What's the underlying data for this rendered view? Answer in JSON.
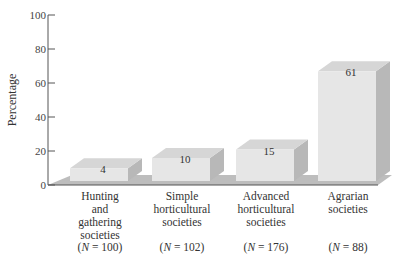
{
  "chart_data": {
    "type": "bar",
    "title": "",
    "xlabel": "",
    "ylabel": "Percentage",
    "ylim": [
      0,
      100
    ],
    "yticks": [
      0,
      20,
      40,
      60,
      80,
      100
    ],
    "grid": false,
    "style": "3d",
    "categories": [
      "Hunting and gathering societies",
      "Simple horticultural societies",
      "Advanced horticultural societies",
      "Agrarian societies"
    ],
    "category_lines": [
      [
        "Hunting",
        "and",
        "gathering",
        "societies"
      ],
      [
        "Simple",
        "horticultural",
        "societies"
      ],
      [
        "Advanced",
        "horticultural",
        "societies"
      ],
      [
        "Agrarian",
        "societies"
      ]
    ],
    "n_labels": [
      "(N = 100)",
      "(N = 102)",
      "(N = 176)",
      "(N = 88)"
    ],
    "values": [
      4,
      10,
      15,
      61
    ],
    "value_labels": [
      "4",
      "10",
      "15",
      "61"
    ],
    "colors": {
      "bar_front": "#e6e6e6",
      "bar_top": "#d6d6d6",
      "bar_side": "#b8b8b8",
      "floor": "#bdbdbd",
      "axis": "#555555"
    }
  }
}
